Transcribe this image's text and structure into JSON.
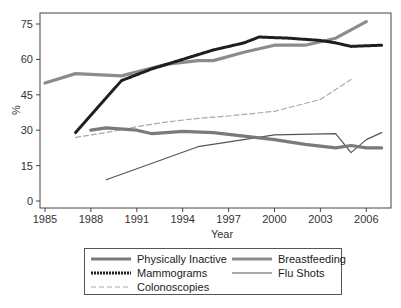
{
  "chart_data": {
    "type": "line",
    "title": "",
    "xlabel": "Year",
    "ylabel": "%",
    "xlim": [
      1985,
      2007
    ],
    "ylim": [
      0,
      78
    ],
    "x_ticks": [
      1985,
      1988,
      1991,
      1994,
      1997,
      2000,
      2003,
      2006
    ],
    "y_ticks": [
      0,
      15,
      30,
      45,
      60,
      75
    ],
    "grid": false,
    "legend_position": "bottom",
    "series": [
      {
        "name": "Physically Inactive",
        "style": "solid-thick",
        "color": "#7a7a7a",
        "points": [
          [
            1988,
            30
          ],
          [
            1989,
            31
          ],
          [
            1991,
            30
          ],
          [
            1992,
            28.5
          ],
          [
            1994,
            29.5
          ],
          [
            1996,
            29
          ],
          [
            1998,
            27.5
          ],
          [
            2000,
            26
          ],
          [
            2002,
            24
          ],
          [
            2004,
            22.5
          ],
          [
            2005,
            23.5
          ],
          [
            2006,
            22.5
          ],
          [
            2007,
            22.5
          ]
        ]
      },
      {
        "name": "Breastfeeding",
        "style": "solid-thick-gray",
        "color": "#8c8c8c",
        "points": [
          [
            1985,
            50
          ],
          [
            1987,
            54
          ],
          [
            1990,
            53
          ],
          [
            1993,
            58
          ],
          [
            1995,
            59.5
          ],
          [
            1996,
            59.5
          ],
          [
            1998,
            63
          ],
          [
            2000,
            66
          ],
          [
            2002,
            66
          ],
          [
            2004,
            69
          ],
          [
            2006,
            76
          ]
        ]
      },
      {
        "name": "Mammograms",
        "style": "dotted-thick",
        "color": "#1e1e1e",
        "points": [
          [
            1987,
            29
          ],
          [
            1990,
            51
          ],
          [
            1992,
            56
          ],
          [
            1994,
            60
          ],
          [
            1996,
            64
          ],
          [
            1998,
            67
          ],
          [
            1999,
            69.5
          ],
          [
            2001,
            69
          ],
          [
            2003,
            68
          ],
          [
            2004,
            67
          ],
          [
            2005,
            65.5
          ],
          [
            2007,
            66
          ]
        ]
      },
      {
        "name": "Flu Shots",
        "style": "solid-thin",
        "color": "#555555",
        "points": [
          [
            1989,
            9
          ],
          [
            1995,
            23
          ],
          [
            2000,
            28
          ],
          [
            2004,
            28.5
          ],
          [
            2005,
            20.5
          ],
          [
            2006,
            26
          ],
          [
            2007,
            29
          ]
        ]
      },
      {
        "name": "Colonoscopies",
        "style": "dashed",
        "color": "#aaaaaa",
        "points": [
          [
            1987,
            27
          ],
          [
            1989,
            29
          ],
          [
            1991,
            31.5
          ],
          [
            1993,
            33.5
          ],
          [
            1995,
            35
          ],
          [
            1997,
            36
          ],
          [
            2000,
            38
          ],
          [
            2003,
            43
          ],
          [
            2005,
            51.5
          ]
        ]
      }
    ]
  },
  "legend": {
    "items": [
      {
        "label": "Physically Inactive"
      },
      {
        "label": "Breastfeeding"
      },
      {
        "label": "Mammograms"
      },
      {
        "label": "Flu Shots"
      },
      {
        "label": "Colonoscopies"
      }
    ]
  }
}
